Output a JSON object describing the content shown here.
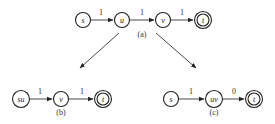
{
  "diagram": {
    "graph_a": {
      "caption": "(a)",
      "nodes": [
        {
          "id": "s",
          "label": "s",
          "x": 83,
          "y": 20,
          "final": false
        },
        {
          "id": "u",
          "label": "u",
          "x": 122,
          "y": 20,
          "final": false
        },
        {
          "id": "v",
          "label": "v",
          "x": 163,
          "y": 20,
          "final": false
        },
        {
          "id": "t",
          "label": "t",
          "x": 203,
          "y": 20,
          "final": true
        }
      ],
      "edges": [
        {
          "from": "s",
          "to": "u",
          "weight": "1"
        },
        {
          "from": "u",
          "to": "v",
          "weight": "1"
        },
        {
          "from": "v",
          "to": "t",
          "weight": "1"
        }
      ]
    },
    "graph_b": {
      "caption": "(b)",
      "nodes": [
        {
          "id": "su",
          "label": "su",
          "x": 21,
          "y": 99,
          "final": false
        },
        {
          "id": "v",
          "label": "v",
          "x": 61,
          "y": 99,
          "final": false
        },
        {
          "id": "t",
          "label": "t",
          "x": 103,
          "y": 99,
          "final": true
        }
      ],
      "edges": [
        {
          "from": "su",
          "to": "v",
          "weight": "1"
        },
        {
          "from": "v",
          "to": "t",
          "weight": "1"
        }
      ]
    },
    "graph_c": {
      "caption": "(c)",
      "nodes": [
        {
          "id": "s",
          "label": "s",
          "x": 171,
          "y": 99,
          "final": false
        },
        {
          "id": "uv",
          "label": "uv",
          "x": 214,
          "y": 99,
          "final": false
        },
        {
          "id": "t",
          "label": "t",
          "x": 254,
          "y": 99,
          "final": true
        }
      ],
      "edges": [
        {
          "from": "s",
          "to": "uv",
          "weight": "1"
        },
        {
          "from": "uv",
          "to": "t",
          "weight": "0"
        }
      ]
    },
    "transitions": [
      {
        "from": "graph_a",
        "to": "graph_b"
      },
      {
        "from": "graph_a",
        "to": "graph_c"
      }
    ]
  }
}
